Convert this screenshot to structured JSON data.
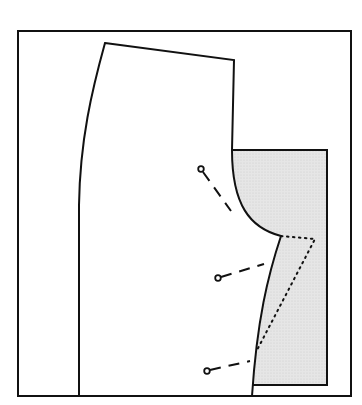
{
  "diagram": {
    "title": "Pattern piece pinned to shaded fabric/pattern",
    "colors": {
      "line": "#111111",
      "shade": "#e4e4e4",
      "background": "#ffffff"
    },
    "outer_frame": {
      "x1": 18,
      "y1": 31,
      "x2": 351,
      "y2": 396
    },
    "shaded_rect": {
      "x1": 232,
      "y1": 150,
      "x2": 327,
      "y2": 385
    },
    "pattern_piece": {
      "outline": "M105,43 L234,60 L232,150 C232,205 250,228 281,236 C268,275 257,320 252,396 L79,396 L79,205 C80,140 92,90 105,43 Z",
      "crotch_point": [
        281,
        236
      ]
    },
    "dotted_line": {
      "points": "281,236 315,239 256,352"
    },
    "pins": [
      {
        "name": "pin-1",
        "head": [
          201,
          169
        ],
        "tail": [
          231,
          211
        ]
      },
      {
        "name": "pin-2",
        "head": [
          218,
          278
        ],
        "tail": [
          264,
          264
        ]
      },
      {
        "name": "pin-3",
        "head": [
          207,
          371
        ],
        "tail": [
          250,
          361
        ]
      }
    ]
  }
}
